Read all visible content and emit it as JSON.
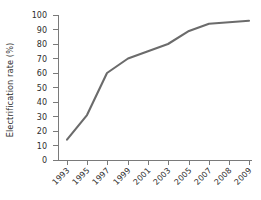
{
  "chart_data": {
    "type": "line",
    "title": "",
    "subtitle": "",
    "xlabel": "",
    "ylabel": "Electrification rate (%)",
    "categories": [
      "1993",
      "1995",
      "1997",
      "1999",
      "2001",
      "2003",
      "2005",
      "2007",
      "2008",
      "2009"
    ],
    "x_tick_labels": [
      "1993",
      "1995",
      "1997",
      "1999",
      "2001",
      "2003",
      "2005",
      "2007",
      "2008",
      "2009"
    ],
    "y_tick_labels": [
      "0",
      "10",
      "20",
      "30",
      "40",
      "50",
      "60",
      "70",
      "80",
      "90",
      "100"
    ],
    "y_ticks": [
      0,
      10,
      20,
      30,
      40,
      50,
      60,
      70,
      80,
      90,
      100
    ],
    "values": [
      14,
      31,
      60,
      70,
      75,
      80,
      89,
      94,
      95,
      96
    ],
    "series": [
      {
        "name": "Electrification rate",
        "values": [
          14,
          31,
          60,
          70,
          75,
          80,
          89,
          94,
          95,
          96
        ],
        "color": "#6b6b6b"
      }
    ],
    "ylim": [
      0,
      100
    ],
    "grid": false,
    "legend": false,
    "legend_position": "none",
    "x_tick_label_rotation": "-45",
    "annotations": []
  },
  "style": {
    "background_color": "#ffffff",
    "axis_color": "#7a7a7a",
    "text_color": "#2e2e2e",
    "line_color": "#6b6b6b"
  }
}
